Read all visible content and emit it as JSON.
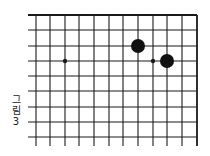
{
  "figure": {
    "caption_chars": [
      "그",
      "림",
      "3"
    ],
    "caption_text": "그림 3"
  },
  "board": {
    "line_color": "#1a1a1a",
    "stone_color": "#111111",
    "edges": {
      "top": true,
      "right": true,
      "left": false,
      "bottom": false
    },
    "columns_x": [
      36,
      50,
      65,
      79,
      94,
      109,
      123,
      138,
      153,
      167,
      182,
      197
    ],
    "rows_y": [
      15,
      30,
      46,
      61,
      76,
      91,
      107,
      122,
      137
    ],
    "star_points": [
      {
        "col": 2,
        "row": 3
      }
    ],
    "marks": [
      {
        "type": "small-dot",
        "col": 8,
        "row": 3
      }
    ],
    "stones": [
      {
        "color": "black",
        "col": 7,
        "row": 2
      },
      {
        "color": "black",
        "col": 9,
        "row": 3
      }
    ]
  }
}
